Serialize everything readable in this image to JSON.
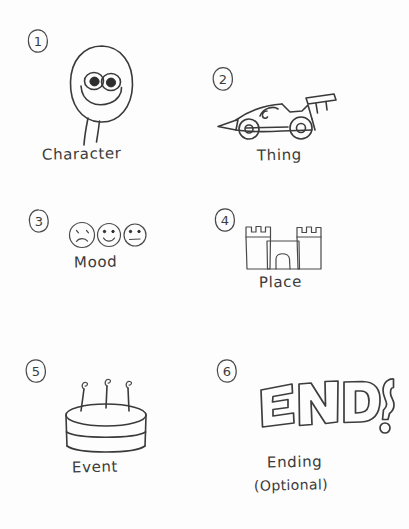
{
  "page": {
    "background_color": "#fdfdfd",
    "ink_color": "#3a3a3a",
    "style": "hand-drawn pencil sketch"
  },
  "items": [
    {
      "number": "1",
      "label": "Character",
      "sublabel": "",
      "icon": "blob-character-icon",
      "icon_description": "egg shaped character with two large eyes, wide smile and two thin legs"
    },
    {
      "number": "2",
      "label": "Thing",
      "sublabel": "",
      "icon": "race-car-icon",
      "icon_description": "formula one race car with pointed nose, two wheels and rear wing"
    },
    {
      "number": "3",
      "label": "Mood",
      "sublabel": "",
      "icon": "mood-faces-icon",
      "icon_description": "three faces: sad, happy, neutral",
      "faces": [
        "sad",
        "happy",
        "neutral"
      ]
    },
    {
      "number": "4",
      "label": "Place",
      "sublabel": "",
      "icon": "castle-icon",
      "icon_description": "castle with two crenellated towers and an arched gate"
    },
    {
      "number": "5",
      "label": "Event",
      "sublabel": "",
      "icon": "birthday-cake-icon",
      "icon_description": "two tier round cake with three lit candles"
    },
    {
      "number": "6",
      "label": "Ending",
      "sublabel": "(Optional)",
      "icon": "end-question-icon",
      "icon_description": "outline bubble letters spelling END followed by a question mark",
      "bubble_text": "END?"
    }
  ]
}
